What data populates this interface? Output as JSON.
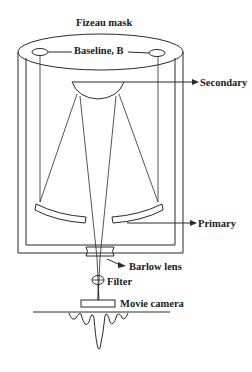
{
  "diagram": {
    "type": "optical-schematic",
    "labels": {
      "mask": "Fizeau mask",
      "baseline": "Baseline, B",
      "secondary": "Secondary",
      "primary": "Primary",
      "barlow": "Barlow lens",
      "filter": "Filter",
      "camera": "Movie camera"
    },
    "colors": {
      "line": "#2a2a2a",
      "text": "#1a1a1a",
      "background": "#ffffff"
    }
  }
}
